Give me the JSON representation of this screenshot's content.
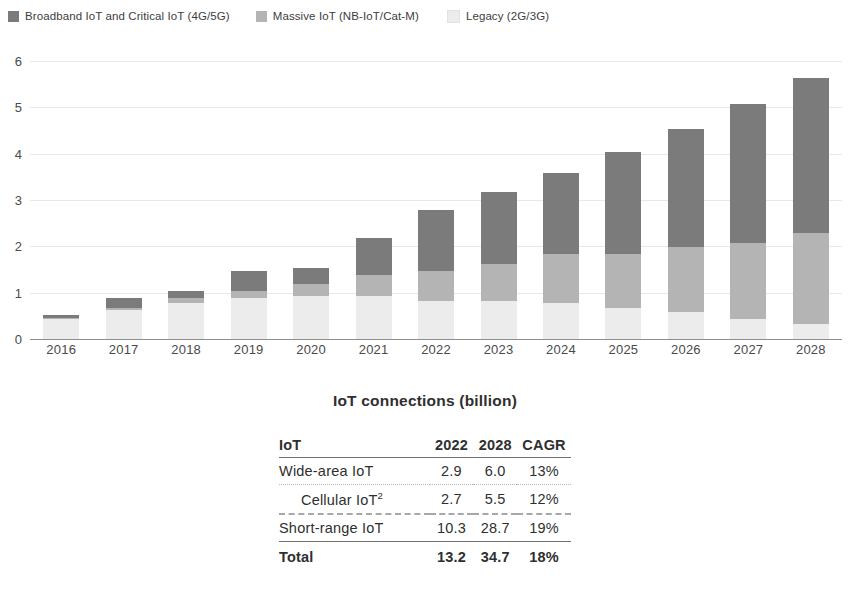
{
  "legend": {
    "items": [
      {
        "label": "Broadband IoT and Critical IoT (4G/5G)",
        "color": "#7b7b7b"
      },
      {
        "label": "Massive IoT (NB-IoT/Cat-M)",
        "color": "#b4b4b4"
      },
      {
        "label": "Legacy (2G/3G)",
        "color": "#ececec"
      }
    ]
  },
  "chart_data": {
    "type": "bar",
    "stacked": true,
    "title": "",
    "xlabel": "",
    "ylabel": "",
    "ylim": [
      0,
      6
    ],
    "yticks": [
      0,
      1,
      2,
      3,
      4,
      5,
      6
    ],
    "grid": true,
    "legend_position": "top-left",
    "categories": [
      "2016",
      "2017",
      "2018",
      "2019",
      "2020",
      "2021",
      "2022",
      "2023",
      "2024",
      "2025",
      "2026",
      "2027",
      "2028"
    ],
    "series": [
      {
        "name": "Legacy (2G/3G)",
        "color": "#ececec",
        "values": [
          0.45,
          0.65,
          0.8,
          0.9,
          0.95,
          0.95,
          0.85,
          0.85,
          0.8,
          0.7,
          0.6,
          0.45,
          0.35
        ]
      },
      {
        "name": "Massive IoT (NB-IoT/Cat-M)",
        "color": "#b4b4b4",
        "values": [
          0.02,
          0.05,
          0.1,
          0.15,
          0.25,
          0.45,
          0.65,
          0.8,
          1.05,
          1.15,
          1.4,
          1.65,
          1.95
        ]
      },
      {
        "name": "Broadband IoT and Critical IoT (4G/5G)",
        "color": "#7b7b7b",
        "values": [
          0.08,
          0.2,
          0.15,
          0.43,
          0.35,
          0.8,
          1.3,
          1.55,
          1.75,
          2.2,
          2.55,
          3.0,
          3.35
        ]
      }
    ],
    "totals": [
      0.55,
      0.9,
      1.05,
      1.48,
      1.55,
      2.2,
      2.8,
      3.2,
      3.6,
      4.05,
      4.55,
      5.1,
      5.65
    ]
  },
  "table": {
    "title": "IoT connections (billion)",
    "columns": [
      "IoT",
      "2022",
      "2028",
      "CAGR"
    ],
    "rows": [
      {
        "name": "Wide-area IoT",
        "sup": "",
        "v2022": "2.9",
        "v2028": "6.0",
        "cagr": "13%"
      },
      {
        "name": "Cellular IoT",
        "sup": "2",
        "v2022": "2.7",
        "v2028": "5.5",
        "cagr": "12%"
      },
      {
        "name": "Short-range IoT",
        "sup": "",
        "v2022": "10.3",
        "v2028": "28.7",
        "cagr": "19%"
      },
      {
        "name": "Total",
        "sup": "",
        "v2022": "13.2",
        "v2028": "34.7",
        "cagr": "18%"
      }
    ]
  }
}
